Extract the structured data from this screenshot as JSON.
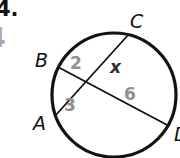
{
  "problem": {
    "number_label": "4.",
    "handwritten_answer": "4"
  },
  "colors": {
    "line": "#121212",
    "point_label": "#121212",
    "segment_number": "#8f8f8f",
    "unknown_value": "#2e2e2e",
    "handwritten": "#a9a9a9"
  },
  "diagram": {
    "point_labels": {
      "a": "A",
      "b": "B",
      "c": "C",
      "d": "D"
    },
    "segment_labels": {
      "b_side": "2",
      "c_side": "x",
      "a_side": "3",
      "d_side": "6"
    }
  }
}
